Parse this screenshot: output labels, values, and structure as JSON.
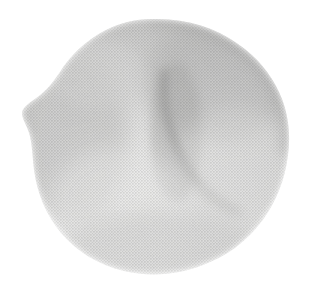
{
  "image": {
    "kind": "scanned-grayscale-photograph",
    "subject_name": "rounded-organic-specimen",
    "subject_description": "Rounded blob-like organic form with a central vertical crease, soft shading and a pointed protrusion on the left edge",
    "width_px": 314,
    "height_px": 300,
    "background_color": "#ffffff",
    "texture": "halftone-print-screen",
    "alt_text": "Grayscale scan of a rounded organic specimen on a plain white background",
    "has_visible_text": false,
    "has_border": false
  },
  "palette": {
    "background": "#ffffff",
    "highlight": "#e9e9e7",
    "light_mid": "#dedede",
    "mid": "#cfcfce",
    "mid_dark": "#c2c2c1",
    "dark": "#b4b4b3",
    "darkest": "#a8a8a7",
    "crease_shadow": "#b0b0af",
    "edge_soft": "#d6d6d5"
  },
  "silhouette": {
    "outline_path": "M 152 19 C 186 18 214 27 238 44 C 258 58 270 73 279 92 C 288 111 291 133 288 155 C 285 180 276 202 262 221 C 247 241 227 256 203 265 C 178 275 150 277 124 271 C 99 265 77 252 61 233 C 46 215 37 193 34 170 C 32 152 32 140 28 130 C 25 122 22 118 22 113 C 22 108 28 104 35 99 C 45 92 52 84 60 72 C 70 56 85 41 104 31 C 119 23 135 19 152 19 Z",
    "left_point": {
      "x": 22,
      "y": 113
    },
    "top_apex": {
      "x": 152,
      "y": 19
    },
    "right_extent": {
      "x": 288,
      "y": 150
    },
    "bottom_extent": {
      "x": 166,
      "y": 276
    }
  },
  "features": {
    "crease": {
      "name": "central-vertical-crease",
      "path": "M 164 72 C 162 96 166 120 174 142 C 180 160 188 173 198 184 C 210 197 224 206 238 212",
      "description": "Dark vertical fold running from upper-middle down and curving to the lower right"
    },
    "shadow_regions": [
      {
        "name": "upper-right-shadow",
        "cx": 222,
        "cy": 78,
        "rx": 78,
        "ry": 62,
        "tone": "#b8b8b7"
      },
      {
        "name": "left-flank-shadow",
        "cx": 72,
        "cy": 140,
        "rx": 56,
        "ry": 82,
        "tone": "#c4c4c3"
      },
      {
        "name": "crease-core-shadow",
        "cx": 176,
        "cy": 132,
        "rx": 26,
        "ry": 70,
        "tone": "#b0b0af"
      },
      {
        "name": "lower-edge-shadow",
        "cx": 160,
        "cy": 246,
        "rx": 96,
        "ry": 34,
        "tone": "#c8c8c7"
      }
    ],
    "highlight_regions": [
      {
        "name": "lower-left-highlight",
        "cx": 118,
        "cy": 206,
        "rx": 70,
        "ry": 58,
        "tone": "#ededec"
      },
      {
        "name": "right-lobe-highlight",
        "cx": 236,
        "cy": 168,
        "rx": 58,
        "ry": 62,
        "tone": "#e4e4e3"
      },
      {
        "name": "upper-left-highlight",
        "cx": 96,
        "cy": 74,
        "rx": 48,
        "ry": 36,
        "tone": "#dcdcdb"
      }
    ]
  }
}
